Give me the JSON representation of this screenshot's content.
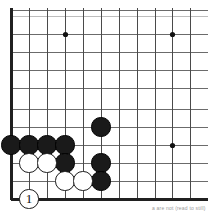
{
  "diagram": {
    "kind": "go-board-diagram",
    "caption": "a are not (read to still)",
    "board": {
      "size": 19,
      "cell": 18,
      "origin_x": 11,
      "origin_y": 199,
      "line_color": "#6b6b6b",
      "edge_color": "#202020",
      "background": "#ffffff",
      "star_color": "#111111",
      "star_radius": 2.6,
      "stone_radius": 9.6,
      "visible_columns": [
        11,
        29,
        47,
        65,
        83,
        101,
        119,
        137,
        155,
        172,
        190
      ],
      "visible_rows": [
        10,
        34,
        52,
        70,
        88,
        109,
        127,
        145,
        163,
        181,
        199
      ],
      "top_partial_row": 16,
      "edges": {
        "left": 11,
        "bottom": 199
      }
    },
    "star_points": [
      {
        "name": "star-point-upper-left",
        "x": 65,
        "y": 34
      },
      {
        "name": "star-point-upper-right",
        "x": 172,
        "y": 34
      },
      {
        "name": "star-point-lower-right",
        "x": 172,
        "y": 145
      }
    ],
    "stones": [
      {
        "name": "black-stone-a1",
        "color": "black",
        "x": 11,
        "y": 145,
        "label": ""
      },
      {
        "name": "black-stone-b1",
        "color": "black",
        "x": 29,
        "y": 145,
        "label": ""
      },
      {
        "name": "black-stone-c1",
        "color": "black",
        "x": 47,
        "y": 145,
        "label": ""
      },
      {
        "name": "black-stone-d1",
        "color": "black",
        "x": 65,
        "y": 145,
        "label": ""
      },
      {
        "name": "black-stone-d2",
        "color": "black",
        "x": 65,
        "y": 163,
        "label": ""
      },
      {
        "name": "black-stone-f0",
        "color": "black",
        "x": 101,
        "y": 127,
        "label": ""
      },
      {
        "name": "black-stone-f2",
        "color": "black",
        "x": 101,
        "y": 163,
        "label": ""
      },
      {
        "name": "black-stone-f3",
        "color": "black",
        "x": 101,
        "y": 181,
        "label": ""
      },
      {
        "name": "white-stone-b2",
        "color": "white",
        "x": 29,
        "y": 163,
        "label": ""
      },
      {
        "name": "white-stone-c2",
        "color": "white",
        "x": 47,
        "y": 163,
        "label": ""
      },
      {
        "name": "white-stone-d3",
        "color": "white",
        "x": 65,
        "y": 181,
        "label": ""
      },
      {
        "name": "white-stone-e3",
        "color": "white",
        "x": 83,
        "y": 181,
        "label": ""
      },
      {
        "name": "white-stone-move-1",
        "color": "white",
        "x": 29,
        "y": 199,
        "label": "1"
      }
    ],
    "caption_position": {
      "x": 152,
      "y": 205
    }
  }
}
